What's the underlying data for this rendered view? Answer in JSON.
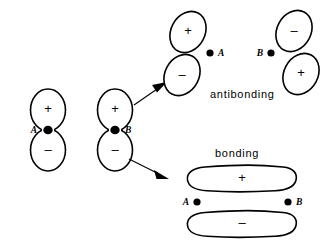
{
  "figure": {
    "width": 332,
    "height": 243,
    "background_color": "#ffffff",
    "stroke_color": "#000000"
  },
  "atomic_orbitals": [
    {
      "id": "orbital-a",
      "atom_label": "A",
      "label_side": "left",
      "top_lobe_sign": "+",
      "bottom_lobe_sign": "–",
      "center_x": 48,
      "node_y": 130
    },
    {
      "id": "orbital-b",
      "atom_label": "B",
      "label_side": "right",
      "top_lobe_sign": "+",
      "bottom_lobe_sign": "–",
      "center_x": 115,
      "node_y": 130
    }
  ],
  "arrows": [
    {
      "id": "arrow-to-antibonding",
      "direction": "up-right",
      "target": "antibonding"
    },
    {
      "id": "arrow-to-bonding",
      "direction": "down-right",
      "target": "bonding"
    }
  ],
  "antibonding": {
    "caption": "antibonding",
    "caption_x": 210,
    "caption_y": 95,
    "orbitals": [
      {
        "id": "antibonding-orbital-a",
        "atom_label": "A",
        "label_side": "right",
        "upper_lobe_sign": "+",
        "lower_lobe_sign": "–",
        "dot_x": 210,
        "dot_y": 53
      },
      {
        "id": "antibonding-orbital-b",
        "atom_label": "B",
        "label_side": "left",
        "upper_lobe_sign": "–",
        "lower_lobe_sign": "+",
        "dot_x": 271,
        "dot_y": 53
      }
    ]
  },
  "bonding": {
    "caption": "bonding",
    "caption_x": 215,
    "caption_y": 154,
    "upper_lobe_sign": "+",
    "lower_lobe_sign": "–",
    "left_atom_label": "A",
    "right_atom_label": "B",
    "left_dot_x": 197,
    "right_dot_x": 288,
    "dot_y": 202
  }
}
